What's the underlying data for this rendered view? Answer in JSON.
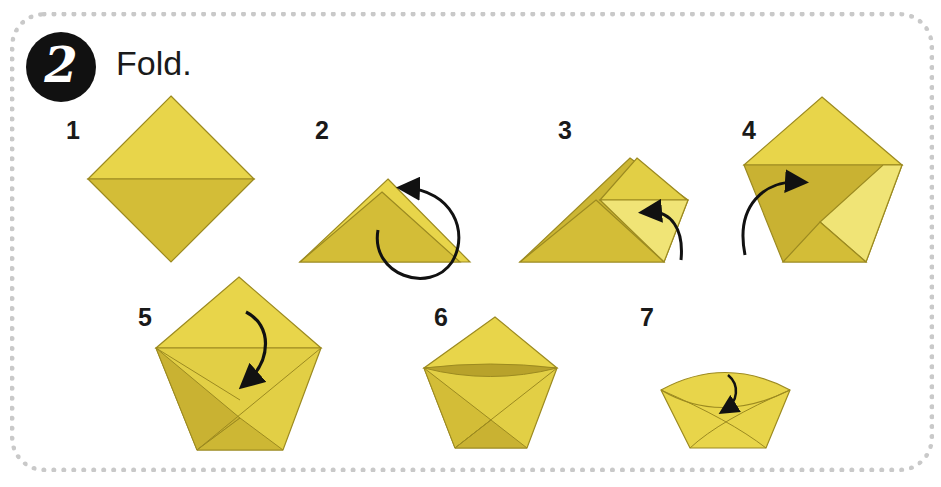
{
  "header": {
    "step_number": "2",
    "title": "Fold."
  },
  "steps": [
    {
      "number": "1",
      "description": "Square diamond with horizontal crease"
    },
    {
      "number": "2",
      "description": "Fold into triangle, turn over"
    },
    {
      "number": "3",
      "description": "Fold corner up"
    },
    {
      "number": "4",
      "description": "Fold left corner across"
    },
    {
      "number": "5",
      "description": "Fold top flap down into pocket"
    },
    {
      "number": "6",
      "description": "Flap tucked"
    },
    {
      "number": "7",
      "description": "Open cup shape"
    }
  ],
  "colors": {
    "paper_light": "#e8d54a",
    "paper_mid": "#d9c33a",
    "paper_dark": "#c4ae2f",
    "paper_pale": "#f0e476",
    "outline": "#9c8a20",
    "arrow": "#111111",
    "frame_dots": "#c9c9c9"
  }
}
